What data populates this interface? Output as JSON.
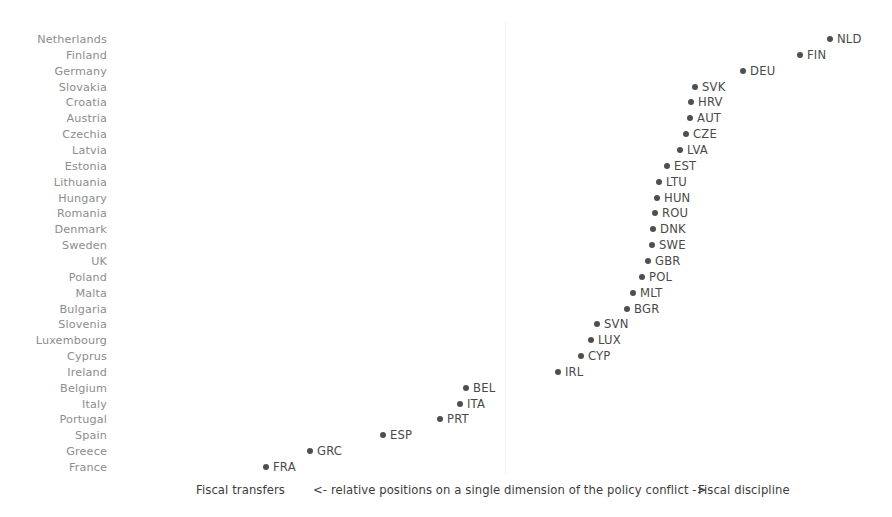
{
  "chart_data": {
    "type": "scatter",
    "title": "",
    "subtitle": "",
    "xlabel": "<- relative positions on a single dimension of the policy conflict ->",
    "ylabel": "",
    "xlim": [
      0,
      1
    ],
    "ylim": [
      0,
      27
    ],
    "grid": false,
    "legend": null,
    "axis_captions": {
      "left": "Fiscal transfers",
      "center": "<- relative positions on a single dimension of the policy conflict ->",
      "right": "Fiscal discipline"
    },
    "colors": {
      "point": "#4f4f4f",
      "point_label": "#4a4a4a",
      "category_label": "#8d8d8d",
      "gridline": "#f4f4f4",
      "background": "#ffffff"
    },
    "categories": [
      "Netherlands",
      "Finland",
      "Germany",
      "Slovakia",
      "Croatia",
      "Austria",
      "Czechia",
      "Latvia",
      "Estonia",
      "Lithuania",
      "Hungary",
      "Romania",
      "Denmark",
      "Sweden",
      "UK",
      "Poland",
      "Malta",
      "Bulgaria",
      "Slovenia",
      "Luxembourg",
      "Cyprus",
      "Ireland",
      "Belgium",
      "Italy",
      "Portugal",
      "Spain",
      "Greece",
      "France"
    ],
    "point_labels": [
      "NLD",
      "FIN",
      "DEU",
      "SVK",
      "HRV",
      "AUT",
      "CZE",
      "LVA",
      "EST",
      "LTU",
      "HUN",
      "ROU",
      "DNK",
      "SWE",
      "GBR",
      "POL",
      "MLT",
      "BGR",
      "SVN",
      "LUX",
      "CYP",
      "IRL",
      "BEL",
      "ITA",
      "PRT",
      "ESP",
      "GRC",
      "FRA"
    ],
    "values": [
      0.9337,
      0.8927,
      0.834,
      0.8009,
      0.7954,
      0.794,
      0.7885,
      0.7803,
      0.7624,
      0.7514,
      0.7487,
      0.7459,
      0.7432,
      0.7418,
      0.7363,
      0.7281,
      0.7199,
      0.7117,
      0.6621,
      0.6538,
      0.6401,
      0.6085,
      0.4545,
      0.4463,
      0.4187,
      0.3402,
      0.2397,
      0.1791
    ],
    "points": [
      {
        "category": "Netherlands",
        "label": "NLD",
        "x": 0.9337,
        "px": 830,
        "py": 39
      },
      {
        "category": "Finland",
        "label": "FIN",
        "x": 0.8927,
        "px": 800,
        "py": 55
      },
      {
        "category": "Germany",
        "label": "DEU",
        "x": 0.834,
        "px": 743,
        "py": 71
      },
      {
        "category": "Slovakia",
        "label": "SVK",
        "x": 0.8009,
        "px": 695,
        "py": 87
      },
      {
        "category": "Croatia",
        "label": "HRV",
        "x": 0.7954,
        "px": 691,
        "py": 102
      },
      {
        "category": "Austria",
        "label": "AUT",
        "x": 0.794,
        "px": 690,
        "py": 118
      },
      {
        "category": "Czechia",
        "label": "CZE",
        "x": 0.7885,
        "px": 686,
        "py": 134
      },
      {
        "category": "Latvia",
        "label": "LVA",
        "x": 0.7803,
        "px": 680,
        "py": 150
      },
      {
        "category": "Estonia",
        "label": "EST",
        "x": 0.7624,
        "px": 667,
        "py": 166
      },
      {
        "category": "Lithuania",
        "label": "LTU",
        "x": 0.7514,
        "px": 659,
        "py": 182
      },
      {
        "category": "Hungary",
        "label": "HUN",
        "x": 0.7487,
        "px": 657,
        "py": 198
      },
      {
        "category": "Romania",
        "label": "ROU",
        "x": 0.7459,
        "px": 655,
        "py": 213
      },
      {
        "category": "Denmark",
        "label": "DNK",
        "x": 0.7432,
        "px": 653,
        "py": 229
      },
      {
        "category": "Sweden",
        "label": "SWE",
        "x": 0.7418,
        "px": 652,
        "py": 245
      },
      {
        "category": "UK",
        "label": "GBR",
        "x": 0.7363,
        "px": 648,
        "py": 261
      },
      {
        "category": "Poland",
        "label": "POL",
        "x": 0.7281,
        "px": 642,
        "py": 277
      },
      {
        "category": "Malta",
        "label": "MLT",
        "x": 0.7199,
        "px": 633,
        "py": 293
      },
      {
        "category": "Bulgaria",
        "label": "BGR",
        "x": 0.7117,
        "px": 627,
        "py": 309
      },
      {
        "category": "Slovenia",
        "label": "SVN",
        "x": 0.6621,
        "px": 597,
        "py": 324
      },
      {
        "category": "Luxembourg",
        "label": "LUX",
        "x": 0.6538,
        "px": 591,
        "py": 340
      },
      {
        "category": "Cyprus",
        "label": "CYP",
        "x": 0.6401,
        "px": 581,
        "py": 356
      },
      {
        "category": "Ireland",
        "label": "IRL",
        "x": 0.6085,
        "px": 558,
        "py": 372
      },
      {
        "category": "Belgium",
        "label": "BEL",
        "x": 0.4545,
        "px": 466,
        "py": 388
      },
      {
        "category": "Italy",
        "label": "ITA",
        "x": 0.4463,
        "px": 460,
        "py": 404
      },
      {
        "category": "Portugal",
        "label": "PRT",
        "x": 0.4187,
        "px": 440,
        "py": 419
      },
      {
        "category": "Spain",
        "label": "ESP",
        "x": 0.3402,
        "px": 383,
        "py": 435
      },
      {
        "category": "Greece",
        "label": "GRC",
        "x": 0.2397,
        "px": 310,
        "py": 451
      },
      {
        "category": "France",
        "label": "FRA",
        "x": 0.1791,
        "px": 266,
        "py": 467
      }
    ],
    "gridlines_x_px": [
      505
    ]
  }
}
